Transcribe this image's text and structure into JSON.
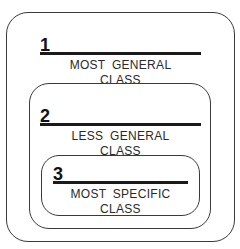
{
  "diagram": {
    "title": "",
    "levels": [
      {
        "number": "1",
        "line1": "MOST GENERAL",
        "line2": "CLASS"
      },
      {
        "number": "2",
        "line1": "LESS GENERAL",
        "line2": "CLASS"
      },
      {
        "number": "3",
        "line1": "MOST SPECIFIC",
        "line2": "CLASS"
      }
    ],
    "colors": {
      "stroke": "#3a3a3a",
      "rule": "#1a1a1a",
      "background": "#ffffff"
    }
  }
}
